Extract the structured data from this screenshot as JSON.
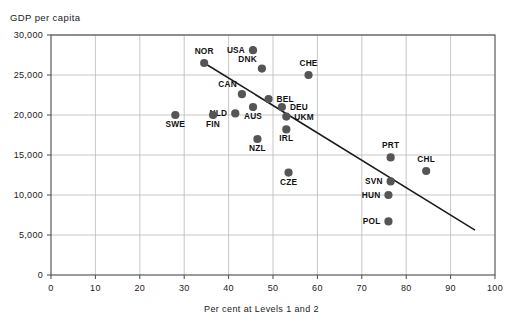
{
  "chart_data": {
    "type": "scatter",
    "title": "",
    "xlabel": "Per cent at Levels 1 and 2",
    "ylabel": "GDP per capita",
    "xlim": [
      0,
      100
    ],
    "ylim": [
      0,
      30000
    ],
    "xticks": [
      0,
      10,
      20,
      30,
      40,
      50,
      60,
      70,
      80,
      90,
      100
    ],
    "xtick_labels": [
      "0",
      "10",
      "20",
      "30",
      "40",
      "50",
      "60",
      "70",
      "80",
      "90",
      "100"
    ],
    "yticks": [
      0,
      5000,
      10000,
      15000,
      20000,
      25000,
      30000
    ],
    "ytick_labels": [
      "0",
      "5,000",
      "10,000",
      "15,000",
      "20,000",
      "25,000",
      "30,000"
    ],
    "grid": true,
    "legend": "none",
    "marker_color": "#555555",
    "trendline": {
      "x0": 34.5,
      "y0": 26500,
      "x1": 95.5,
      "y1": 5600,
      "color": "#1a1a1a"
    },
    "points": [
      {
        "label": "NOR",
        "x": 34.5,
        "y": 26500,
        "label_pos": "above"
      },
      {
        "label": "USA",
        "x": 45.5,
        "y": 28100,
        "label_pos": "left"
      },
      {
        "label": "DNK",
        "x": 47.5,
        "y": 25800,
        "label_pos": "above-left"
      },
      {
        "label": "CHE",
        "x": 58.0,
        "y": 25000,
        "label_pos": "above"
      },
      {
        "label": "CAN",
        "x": 43.0,
        "y": 22600,
        "label_pos": "above-left"
      },
      {
        "label": "BEL",
        "x": 49.0,
        "y": 22000,
        "label_pos": "right"
      },
      {
        "label": "DEU",
        "x": 52.0,
        "y": 21000,
        "label_pos": "right"
      },
      {
        "label": "NLD",
        "x": 41.5,
        "y": 20200,
        "label_pos": "left"
      },
      {
        "label": "AUS",
        "x": 45.5,
        "y": 21000,
        "label_pos": "below"
      },
      {
        "label": "SWE",
        "x": 28.0,
        "y": 20000,
        "label_pos": "below"
      },
      {
        "label": "FIN",
        "x": 36.5,
        "y": 20000,
        "label_pos": "below"
      },
      {
        "label": "UKM",
        "x": 53.0,
        "y": 19800,
        "label_pos": "right"
      },
      {
        "label": "IRL",
        "x": 53.0,
        "y": 18200,
        "label_pos": "below"
      },
      {
        "label": "NZL",
        "x": 46.5,
        "y": 17000,
        "label_pos": "below"
      },
      {
        "label": "PRT",
        "x": 76.5,
        "y": 14700,
        "label_pos": "above"
      },
      {
        "label": "CHL",
        "x": 84.5,
        "y": 13000,
        "label_pos": "above"
      },
      {
        "label": "CZE",
        "x": 53.5,
        "y": 12800,
        "label_pos": "below"
      },
      {
        "label": "SVN",
        "x": 76.5,
        "y": 11700,
        "label_pos": "left"
      },
      {
        "label": "HUN",
        "x": 76.0,
        "y": 10000,
        "label_pos": "below-left"
      },
      {
        "label": "POL",
        "x": 76.0,
        "y": 6700,
        "label_pos": "below-left"
      }
    ]
  }
}
